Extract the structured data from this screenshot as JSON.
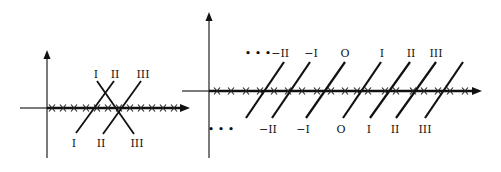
{
  "figures": [
    {
      "id": "left",
      "vertical_axis": {
        "x": 47,
        "y1": 50,
        "y2": 158
      },
      "horizontal_axis": {
        "y": 108,
        "x1": 20,
        "x2": 190
      },
      "thick_from": 47,
      "crosses_x": [
        52,
        63,
        74,
        86,
        97,
        108,
        119,
        130,
        141,
        152,
        163,
        174
      ],
      "lines": [
        {
          "x1": 76,
          "y1": 133,
          "x2": 114,
          "y2": 81
        },
        {
          "x1": 97,
          "y1": 81,
          "x2": 134,
          "y2": 134
        },
        {
          "x1": 103,
          "y1": 134,
          "x2": 141,
          "y2": 81
        }
      ],
      "top_labels": [
        {
          "text": "I",
          "x": 96,
          "y": 78
        },
        {
          "text": "II",
          "x": 115,
          "y": 78
        },
        {
          "text": "III",
          "x": 143,
          "y": 78
        }
      ],
      "bottom_labels": [
        {
          "text": "I",
          "x": 74,
          "y": 147
        },
        {
          "text": "II",
          "x": 101,
          "y": 147
        },
        {
          "text": "III",
          "x": 137,
          "y": 147
        }
      ]
    },
    {
      "id": "right",
      "vertical_axis": {
        "x": 209,
        "y1": 12,
        "y2": 158
      },
      "horizontal_axis": {
        "y": 91,
        "x1": 182,
        "x2": 482
      },
      "thick_from": 209,
      "crosses_x": [
        217,
        231,
        246,
        260,
        274,
        288,
        302,
        317,
        331,
        345,
        357,
        368,
        385,
        396,
        413,
        424,
        438,
        450,
        465
      ],
      "lines": [
        {
          "x1": 246,
          "y1": 118,
          "x2": 284,
          "y2": 62
        },
        {
          "x1": 272,
          "y1": 118,
          "x2": 310,
          "y2": 62
        },
        {
          "x1": 306,
          "y1": 118,
          "x2": 345,
          "y2": 62
        },
        {
          "x1": 343,
          "y1": 118,
          "x2": 381,
          "y2": 62
        },
        {
          "x1": 370,
          "y1": 118,
          "x2": 410,
          "y2": 62
        },
        {
          "x1": 396,
          "y1": 118,
          "x2": 436,
          "y2": 62
        },
        {
          "x1": 425,
          "y1": 118,
          "x2": 463,
          "y2": 62
        }
      ],
      "top_labels": [
        {
          "text": "• • •−II",
          "x": 267,
          "y": 57
        },
        {
          "text": "−I",
          "x": 311,
          "y": 57
        },
        {
          "text": "O",
          "x": 345,
          "y": 57
        },
        {
          "text": "I",
          "x": 382,
          "y": 57
        },
        {
          "text": "II",
          "x": 411,
          "y": 57
        },
        {
          "text": "III",
          "x": 436,
          "y": 57
        }
      ],
      "bottom_labels": [
        {
          "text": "• • •",
          "x": 221,
          "y": 133
        },
        {
          "text": "−II",
          "x": 268,
          "y": 133
        },
        {
          "text": "−I",
          "x": 303,
          "y": 133
        },
        {
          "text": "O",
          "x": 341,
          "y": 133
        },
        {
          "text": "I",
          "x": 369,
          "y": 133
        },
        {
          "text": "II",
          "x": 395,
          "y": 133
        },
        {
          "text": "III",
          "x": 425,
          "y": 133
        }
      ]
    }
  ]
}
